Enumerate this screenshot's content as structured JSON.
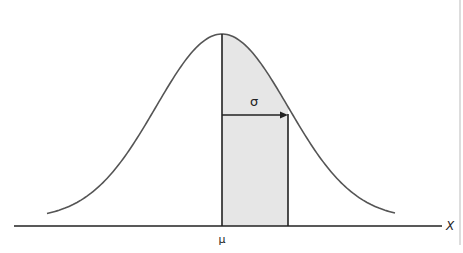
{
  "diagram": {
    "type": "normal-distribution",
    "labels": {
      "sigma": "σ",
      "mu": "μ",
      "x_axis": "X"
    },
    "colors": {
      "curve": "#555555",
      "axis": "#222222",
      "shade": "#e6e6e6",
      "border": "#bbbbbb"
    },
    "shaded_region": "μ to μ+σ"
  }
}
